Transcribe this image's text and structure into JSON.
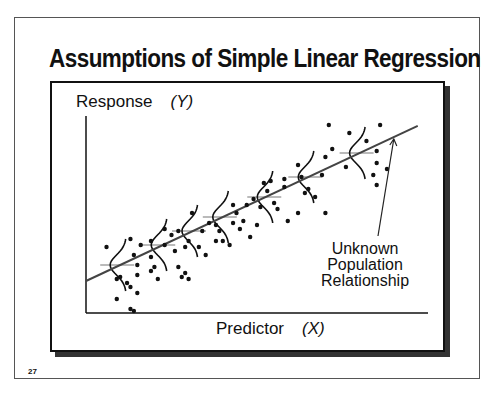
{
  "slide": {
    "title": "Assumptions of Simple Linear Regression",
    "page_number": "27"
  },
  "chart_data": {
    "type": "scatter",
    "title": "Assumptions of Simple Linear Regression",
    "ylabel": "Response",
    "ylabel_var": "(Y)",
    "xlabel": "Predictor",
    "xlabel_var": "(X)",
    "annotation": [
      "Unknown",
      "Population",
      "Relationship"
    ],
    "xlim": [
      0,
      10
    ],
    "ylim": [
      0,
      10
    ],
    "grid": false,
    "regression_line": {
      "intercept": 1.6,
      "slope": 0.8,
      "x_range": [
        0,
        9.7
      ]
    },
    "distributions": [
      {
        "x": 1.0,
        "mean": 2.4
      },
      {
        "x": 2.2,
        "mean": 3.4
      },
      {
        "x": 3.1,
        "mean": 4.1
      },
      {
        "x": 4.0,
        "mean": 4.8
      },
      {
        "x": 5.3,
        "mean": 5.8
      },
      {
        "x": 6.5,
        "mean": 6.8
      },
      {
        "x": 8.0,
        "mean": 8.0
      }
    ],
    "points": [
      [
        0.6,
        3.3
      ],
      [
        1.3,
        3.7
      ],
      [
        1.6,
        3.4
      ],
      [
        1.9,
        2.8
      ],
      [
        1.4,
        2.9
      ],
      [
        1.5,
        2.4
      ],
      [
        0.9,
        1.7
      ],
      [
        1.2,
        1.5
      ],
      [
        1.3,
        1.3
      ],
      [
        1.5,
        1.0
      ],
      [
        1.9,
        2.1
      ],
      [
        2.1,
        1.7
      ],
      [
        1.0,
        1.8
      ],
      [
        1.5,
        1.9
      ],
      [
        1.9,
        3.6
      ],
      [
        2.3,
        3.4
      ],
      [
        2.5,
        3.9
      ],
      [
        2.7,
        4.1
      ],
      [
        2.6,
        3.1
      ],
      [
        2.0,
        2.3
      ],
      [
        2.7,
        2.3
      ],
      [
        2.9,
        2.0
      ],
      [
        2.8,
        1.8
      ],
      [
        3.0,
        1.7
      ],
      [
        2.3,
        4.2
      ],
      [
        2.9,
        3.3
      ],
      [
        3.0,
        3.6
      ],
      [
        3.4,
        4.1
      ],
      [
        3.6,
        4.5
      ],
      [
        3.8,
        4.4
      ],
      [
        3.3,
        3.3
      ],
      [
        3.5,
        2.9
      ],
      [
        3.9,
        4.1
      ],
      [
        4.0,
        3.6
      ],
      [
        3.8,
        3.6
      ],
      [
        4.2,
        3.4
      ],
      [
        3.1,
        5.0
      ],
      [
        4.3,
        4.5
      ],
      [
        4.4,
        5.0
      ],
      [
        4.6,
        4.6
      ],
      [
        4.5,
        4.2
      ],
      [
        4.7,
        5.4
      ],
      [
        4.9,
        5.7
      ],
      [
        4.3,
        5.4
      ],
      [
        5.0,
        4.4
      ],
      [
        5.1,
        5.3
      ],
      [
        4.8,
        3.8
      ],
      [
        5.3,
        6.1
      ],
      [
        5.8,
        6.3
      ],
      [
        5.5,
        5.5
      ],
      [
        5.6,
        5.2
      ],
      [
        5.9,
        4.6
      ],
      [
        5.4,
        6.6
      ],
      [
        5.2,
        6.5
      ],
      [
        6.2,
        5.0
      ],
      [
        5.8,
        6.7
      ],
      [
        6.2,
        7.4
      ],
      [
        6.3,
        6.8
      ],
      [
        6.5,
        6.2
      ],
      [
        6.9,
        6.9
      ],
      [
        7.0,
        7.8
      ],
      [
        6.7,
        5.8
      ],
      [
        7.0,
        5.0
      ],
      [
        6.4,
        6.0
      ],
      [
        7.2,
        8.2
      ],
      [
        7.7,
        9.0
      ],
      [
        8.2,
        8.6
      ],
      [
        8.5,
        8.1
      ],
      [
        8.5,
        7.5
      ],
      [
        8.4,
        6.9
      ],
      [
        8.8,
        7.2
      ],
      [
        8.6,
        9.4
      ],
      [
        7.6,
        7.3
      ],
      [
        7.1,
        9.4
      ],
      [
        8.5,
        6.4
      ],
      [
        0.9,
        0.7
      ],
      [
        1.4,
        0.1
      ],
      [
        1.3,
        0.2
      ]
    ]
  }
}
